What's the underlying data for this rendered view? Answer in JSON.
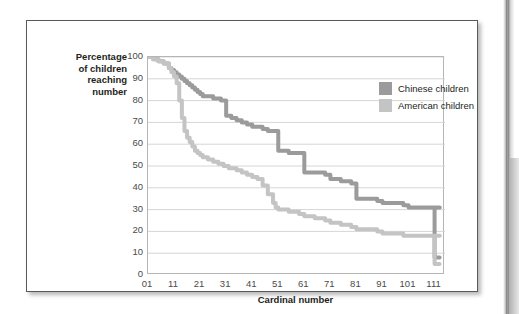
{
  "figure": {
    "y_axis_caption": "Percentage\nof children\nreaching\nnumber",
    "x_axis_caption": "Cardinal number"
  },
  "legend": {
    "position": "top-right-inside",
    "entries": [
      {
        "label": "Chinese children",
        "color": "#9b9b9b",
        "swatch_name": "legend-swatch-chinese"
      },
      {
        "label": "American children",
        "color": "#c4c4c4",
        "swatch_name": "legend-swatch-american"
      }
    ]
  },
  "colors": {
    "chinese": "#9b9b9b",
    "american": "#c4c4c4",
    "gridline": "#d6d6d6",
    "axis": "#b5b5b5",
    "text": "#231f20",
    "tick_text": "#4b4b4b",
    "frame": "#58595b"
  },
  "chart_data": {
    "type": "line",
    "title": "",
    "subtitle": "",
    "xlabel": "Cardinal number",
    "ylabel": "Percentage of children reaching number",
    "xlim": [
      1,
      115
    ],
    "ylim": [
      0,
      100
    ],
    "xticks": [
      1,
      11,
      21,
      31,
      41,
      51,
      61,
      71,
      81,
      91,
      101,
      111
    ],
    "xtick_labels": [
      "01",
      "11",
      "21",
      "31",
      "41",
      "51",
      "61",
      "71",
      "81",
      "91",
      "101",
      "111"
    ],
    "yticks": [
      0,
      10,
      20,
      30,
      40,
      50,
      60,
      70,
      80,
      90,
      100
    ],
    "ytick_labels": [
      "0",
      "10",
      "20",
      "30",
      "40",
      "50",
      "60",
      "70",
      "80",
      "90",
      "100"
    ],
    "grid": "horizontal",
    "legend_position": "upper right",
    "series": [
      {
        "name": "Chinese children",
        "color": "#9b9b9b",
        "x": [
          1,
          3,
          5,
          7,
          9,
          10,
          11,
          12,
          13,
          14,
          15,
          16,
          17,
          18,
          19,
          20,
          21,
          22,
          24,
          26,
          28,
          29,
          30,
          31,
          32,
          33,
          35,
          37,
          39,
          40,
          41,
          43,
          45,
          47,
          49,
          50,
          51,
          55,
          59,
          60,
          61,
          65,
          69,
          70,
          71,
          75,
          79,
          80,
          81,
          85,
          89,
          90,
          91,
          95,
          99,
          100,
          101,
          103,
          105,
          107,
          109,
          110,
          111,
          112,
          113
        ],
        "y": [
          100,
          99,
          98,
          97,
          95,
          94,
          93,
          92,
          91,
          90,
          89,
          88,
          87,
          86,
          85,
          84,
          83,
          82,
          82,
          81,
          81,
          80,
          80,
          73,
          73,
          72,
          71,
          70,
          69,
          69,
          68,
          68,
          67,
          66,
          66,
          66,
          57,
          56,
          56,
          56,
          47,
          47,
          46,
          46,
          44,
          43,
          42,
          42,
          35,
          35,
          34,
          34,
          33,
          33,
          32,
          32,
          31,
          31,
          31,
          31,
          31,
          31,
          31,
          31,
          31
        ]
      },
      {
        "name": "American children",
        "color": "#c4c4c4",
        "x": [
          1,
          3,
          5,
          7,
          9,
          10,
          11,
          12,
          13,
          14,
          15,
          16,
          17,
          18,
          19,
          20,
          21,
          22,
          24,
          26,
          28,
          29,
          30,
          31,
          32,
          33,
          35,
          37,
          39,
          40,
          41,
          43,
          45,
          47,
          49,
          50,
          51,
          55,
          59,
          60,
          61,
          65,
          69,
          70,
          71,
          75,
          79,
          80,
          81,
          85,
          89,
          90,
          91,
          95,
          99,
          100,
          101,
          103,
          105,
          107,
          109,
          110,
          111,
          112,
          113
        ],
        "y": [
          100,
          99,
          98,
          97,
          95,
          93,
          91,
          88,
          80,
          72,
          66,
          63,
          61,
          59,
          57,
          56,
          55,
          54,
          53,
          52,
          51,
          51,
          50,
          50,
          49,
          49,
          48,
          47,
          46,
          46,
          45,
          44,
          41,
          37,
          33,
          31,
          30,
          29,
          28,
          28,
          27,
          26,
          25,
          25,
          24,
          23,
          22,
          22,
          21,
          21,
          20,
          20,
          19,
          19,
          18,
          18,
          18,
          18,
          18,
          18,
          18,
          18,
          18,
          18,
          18
        ]
      }
    ],
    "annotations": [
      {
        "text": "Both curves drop sharply to near 5-10 at the far right around cardinal number 111.",
        "visible": false
      }
    ],
    "endpoint_drop": {
      "x": 111,
      "chinese_final": 8,
      "american_final": 5
    }
  }
}
